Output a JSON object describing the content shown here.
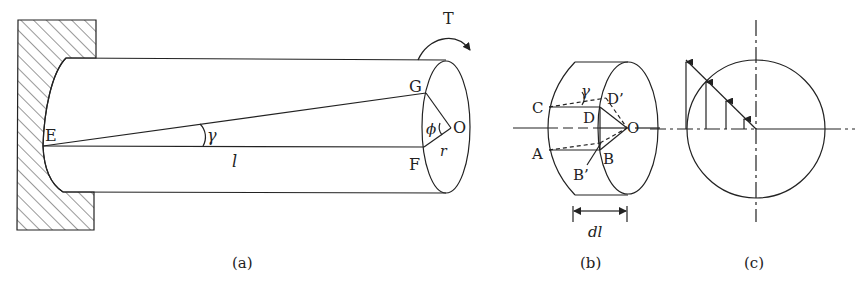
{
  "figure": {
    "panels": [
      {
        "id": "a",
        "caption": "(a)",
        "labels": {
          "torque": "T",
          "point_E": "E",
          "point_G": "G",
          "point_F": "F",
          "point_O": "O",
          "shear_angle": "γ",
          "twist_angle": "ϕ",
          "radius": "r",
          "length": "l"
        }
      },
      {
        "id": "b",
        "caption": "(b)",
        "labels": {
          "point_C": "C",
          "point_D": "D",
          "point_D_prime": "D’",
          "point_A": "A",
          "point_B": "B",
          "point_B_prime": "B’",
          "point_O": "O",
          "shear_angle": "γ",
          "element_length": "dl"
        }
      },
      {
        "id": "c",
        "caption": "(c)",
        "description": "linear shear stress distribution across radius"
      }
    ]
  },
  "colors": {
    "stroke": "#222222",
    "background": "#ffffff"
  }
}
